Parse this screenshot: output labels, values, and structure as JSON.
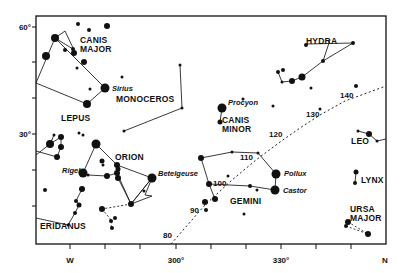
{
  "chart_data": {
    "type": "scatter",
    "title": "",
    "frame": {
      "left": 36,
      "top": 16,
      "right": 386,
      "bottom": 244
    },
    "y_axis": {
      "labels": [
        {
          "text": "60°",
          "y": 27
        },
        {
          "text": "30°",
          "y": 134
        }
      ],
      "ticks": [
        27,
        62,
        98,
        134,
        170,
        206
      ]
    },
    "x_axis": {
      "labels": [
        {
          "text": "W",
          "x": 70
        },
        {
          "text": "300°",
          "x": 176
        },
        {
          "text": "330°",
          "x": 281
        },
        {
          "text": "N",
          "x": 385
        }
      ],
      "ticks": [
        70,
        105,
        140,
        176,
        211,
        246,
        281,
        316,
        351
      ]
    },
    "ecliptic": {
      "style": "dashed",
      "points": [
        [
          171,
          244
        ],
        [
          205,
          205
        ],
        [
          232,
          180
        ],
        [
          256,
          160
        ],
        [
          280,
          142
        ],
        [
          300,
          128
        ],
        [
          320,
          115
        ],
        [
          345,
          101
        ],
        [
          386,
          86
        ]
      ],
      "marks": [
        {
          "text": "80",
          "x": 163,
          "y": 238
        },
        {
          "text": "90",
          "x": 190,
          "y": 213
        },
        {
          "text": "100",
          "x": 213,
          "y": 186
        },
        {
          "text": "110",
          "x": 240,
          "y": 160
        },
        {
          "text": "120",
          "x": 269,
          "y": 137
        },
        {
          "text": "130",
          "x": 306,
          "y": 117
        },
        {
          "text": "140",
          "x": 340,
          "y": 98
        }
      ]
    },
    "constellations": [
      {
        "name": "CANIS MAJOR",
        "label_lines": [
          "CANIS",
          "MAJOR"
        ],
        "label_x": 80,
        "label_y": 43
      },
      {
        "name": "HYDRA",
        "label_lines": [
          "HYDRA"
        ],
        "label_x": 306,
        "label_y": 44
      },
      {
        "name": "MONOCEROS",
        "label_lines": [
          "MONOCEROS"
        ],
        "label_x": 116,
        "label_y": 102
      },
      {
        "name": "CANIS MINOR",
        "label_lines": [
          "CANIS",
          "MINOR"
        ],
        "label_x": 222,
        "label_y": 123
      },
      {
        "name": "LEPUS",
        "label_lines": [
          "LEPUS"
        ],
        "label_x": 61,
        "label_y": 121
      },
      {
        "name": "ORION",
        "label_lines": [
          "ORION"
        ],
        "label_x": 115,
        "label_y": 160
      },
      {
        "name": "LEO",
        "label_lines": [
          "LEO"
        ],
        "label_x": 351,
        "label_y": 144
      },
      {
        "name": "GEMINI",
        "label_lines": [
          "GEMINI"
        ],
        "label_x": 230,
        "label_y": 204
      },
      {
        "name": "LYNX",
        "label_lines": [
          "LYNX"
        ],
        "label_x": 361,
        "label_y": 183
      },
      {
        "name": "URSA MAJOR",
        "label_lines": [
          "URSA",
          "MAJOR"
        ],
        "label_x": 350,
        "label_y": 212
      },
      {
        "name": "ERIDANUS",
        "label_lines": [
          "ERIDANUS"
        ],
        "label_x": 40,
        "label_y": 229
      }
    ],
    "named_stars": [
      {
        "name": "Sirius",
        "x": 105,
        "y": 88,
        "label_x": 112,
        "label_y": 91
      },
      {
        "name": "Procyon",
        "x": 222,
        "y": 108,
        "label_x": 228,
        "label_y": 105
      },
      {
        "name": "Rigel",
        "x": 83,
        "y": 173,
        "label_x": 62,
        "label_y": 173
      },
      {
        "name": "Betelgeuse",
        "x": 152,
        "y": 178,
        "label_x": 158,
        "label_y": 176
      },
      {
        "name": "Pollux",
        "x": 276,
        "y": 174,
        "label_x": 284,
        "label_y": 176
      },
      {
        "name": "Castor",
        "x": 275,
        "y": 190,
        "label_x": 283,
        "label_y": 193
      }
    ],
    "stars": [
      [
        55,
        38,
        4
      ],
      [
        78,
        24,
        2
      ],
      [
        89,
        30,
        2
      ],
      [
        107,
        26,
        3
      ],
      [
        46,
        56,
        4
      ],
      [
        65,
        50,
        2
      ],
      [
        74,
        53,
        3
      ],
      [
        73,
        49,
        2
      ],
      [
        84,
        62,
        3
      ],
      [
        77,
        68,
        1.5
      ],
      [
        90,
        89,
        1.5
      ],
      [
        87,
        104,
        4
      ],
      [
        122,
        77,
        1.5
      ],
      [
        180,
        65,
        1.5
      ],
      [
        182,
        108,
        1.5
      ],
      [
        124,
        131,
        1.5
      ],
      [
        220,
        122,
        2.5
      ],
      [
        243,
        99,
        1.5
      ],
      [
        306,
        45,
        2
      ],
      [
        353,
        43,
        2
      ],
      [
        323,
        61,
        2
      ],
      [
        278,
        72,
        2
      ],
      [
        283,
        70,
        2
      ],
      [
        282,
        82,
        1.5
      ],
      [
        292,
        81,
        3
      ],
      [
        302,
        77,
        3.5
      ],
      [
        356,
        86,
        2
      ],
      [
        311,
        88,
        1.5
      ],
      [
        320,
        109,
        1.5
      ],
      [
        273,
        106,
        1.5
      ],
      [
        358,
        131,
        1.5
      ],
      [
        369,
        134,
        3
      ],
      [
        377,
        141,
        1.5
      ],
      [
        54,
        135,
        1.5
      ],
      [
        61,
        137,
        3
      ],
      [
        50,
        144,
        4
      ],
      [
        61,
        147,
        3
      ],
      [
        57,
        157,
        3
      ],
      [
        79,
        133,
        1.5
      ],
      [
        83,
        135,
        1.5
      ],
      [
        96,
        144,
        4.5
      ],
      [
        102,
        161,
        2.5
      ],
      [
        103,
        165,
        1.5
      ],
      [
        117,
        165,
        3
      ],
      [
        118,
        169,
        2.5
      ],
      [
        117,
        173,
        3
      ],
      [
        107,
        176,
        3
      ],
      [
        88,
        175,
        1.5
      ],
      [
        118,
        178,
        3
      ],
      [
        82,
        189,
        3
      ],
      [
        76,
        201,
        2
      ],
      [
        79,
        205,
        2.5
      ],
      [
        75,
        213,
        2
      ],
      [
        68,
        225,
        1.5
      ],
      [
        45,
        190,
        2
      ],
      [
        102,
        209,
        3
      ],
      [
        144,
        191,
        1.5
      ],
      [
        112,
        228,
        2
      ],
      [
        115,
        218,
        2
      ],
      [
        111,
        221,
        2
      ],
      [
        201,
        158,
        3
      ],
      [
        209,
        184,
        3
      ],
      [
        215,
        199,
        3
      ],
      [
        205,
        202,
        3
      ],
      [
        206,
        210,
        2
      ],
      [
        228,
        176,
        1.5
      ],
      [
        232,
        152,
        1.5
      ],
      [
        258,
        153,
        1.5
      ],
      [
        250,
        186,
        2
      ],
      [
        257,
        190,
        1.5
      ],
      [
        244,
        214,
        1.5
      ],
      [
        131,
        204,
        3
      ],
      [
        356,
        172,
        2.5
      ],
      [
        355,
        183,
        2
      ],
      [
        348,
        222,
        3
      ],
      [
        346,
        226,
        2
      ],
      [
        368,
        234,
        3
      ]
    ],
    "lines": [
      [
        [
          36,
          83
        ],
        [
          55,
          38
        ],
        [
          65,
          31
        ],
        [
          74,
          50
        ]
      ],
      [
        [
          55,
          38
        ],
        [
          73,
          49
        ]
      ],
      [
        [
          55,
          38
        ],
        [
          105,
          88
        ],
        [
          87,
          104
        ],
        [
          36,
          83
        ]
      ],
      [
        [
          36,
          35
        ],
        [
          36,
          35
        ]
      ],
      [
        [
          124,
          131
        ],
        [
          182,
          108
        ],
        [
          180,
          65
        ]
      ],
      [
        [
          222,
          108
        ],
        [
          220,
          122
        ]
      ],
      [
        [
          306,
          44
        ],
        [
          353,
          43
        ]
      ],
      [
        [
          353,
          43
        ],
        [
          323,
          61
        ],
        [
          302,
          77
        ],
        [
          292,
          81
        ],
        [
          282,
          82
        ],
        [
          278,
          72
        ]
      ],
      [
        [
          323,
          61
        ],
        [
          330,
          40
        ]
      ],
      [
        [
          358,
          131
        ],
        [
          369,
          134
        ],
        [
          377,
          141
        ],
        [
          386,
          139
        ]
      ],
      [
        [
          50,
          144
        ],
        [
          61,
          137
        ],
        [
          61,
          147
        ],
        [
          57,
          157
        ]
      ],
      [
        [
          50,
          144
        ],
        [
          36,
          155
        ]
      ],
      [
        [
          57,
          157
        ],
        [
          36,
          151
        ]
      ],
      [
        [
          54,
          135
        ],
        [
          50,
          144
        ]
      ],
      [
        [
          83,
          173
        ],
        [
          96,
          144
        ],
        [
          117,
          165
        ],
        [
          152,
          178
        ],
        [
          131,
          204
        ],
        [
          117,
          173
        ],
        [
          107,
          176
        ],
        [
          88,
          175
        ]
      ],
      [
        [
          117,
          173
        ],
        [
          118,
          178
        ],
        [
          131,
          204
        ],
        [
          152,
          178
        ]
      ],
      [
        [
          82,
          189
        ],
        [
          76,
          201
        ],
        [
          79,
          205
        ],
        [
          75,
          213
        ],
        [
          68,
          225
        ],
        [
          36,
          218
        ]
      ],
      [
        [
          152,
          178
        ],
        [
          145,
          195
        ],
        [
          152,
          196
        ],
        [
          131,
          204
        ]
      ],
      [
        [
          201,
          158
        ],
        [
          209,
          184
        ],
        [
          215,
          199
        ]
      ],
      [
        [
          201,
          158
        ],
        [
          232,
          152
        ],
        [
          258,
          153
        ],
        [
          276,
          174
        ],
        [
          275,
          190
        ],
        [
          250,
          186
        ],
        [
          209,
          184
        ]
      ],
      [
        [
          356,
          172
        ],
        [
          355,
          183
        ]
      ]
    ],
    "dashed_lines": [
      [
        [
          131,
          204
        ],
        [
          102,
          209
        ]
      ],
      [
        [
          102,
          209
        ],
        [
          112,
          221
        ],
        [
          111,
          228
        ]
      ],
      [
        [
          348,
          222
        ],
        [
          368,
          234
        ]
      ],
      [
        [
          346,
          226
        ],
        [
          368,
          234
        ]
      ]
    ]
  }
}
